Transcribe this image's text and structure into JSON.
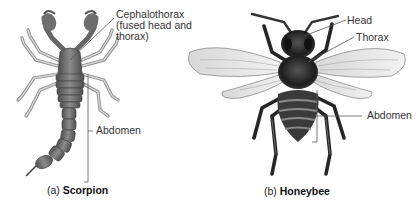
{
  "panels": [
    {
      "id": "a",
      "organism": "Scorpion",
      "caption_prefix": "(a)",
      "caption_name": "Scorpion",
      "labels": {
        "cephalothorax_line1": "Cephalothorax",
        "cephalothorax_line2": "(fused head and",
        "cephalothorax_line3": "thorax)",
        "abdomen": "Abdomen"
      }
    },
    {
      "id": "b",
      "organism": "Honeybee",
      "caption_prefix": "(b)",
      "caption_name": "Honeybee",
      "labels": {
        "head": "Head",
        "thorax": "Thorax",
        "abdomen": "Abdomen"
      }
    }
  ],
  "colors": {
    "background": "#ffffff",
    "leader_line": "#555555",
    "scorpion_body": "#7a7a7a",
    "scorpion_legs": "#b5b5b5",
    "bee_body": "#2a2a2a",
    "bee_wing": "#e6e6e6"
  }
}
